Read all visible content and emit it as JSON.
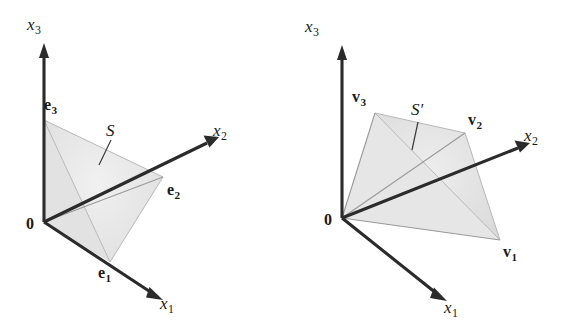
{
  "figure": {
    "background_color": "#ffffff",
    "ink_color": "#2b2b2b",
    "face_fill_color": "#e8e8e8",
    "edge_color": "#b9b9b9"
  },
  "panels": [
    {
      "id": "left",
      "region_label": "standard-simplex-panel",
      "set_label": {
        "text": "S",
        "prime": "",
        "style": "italic"
      },
      "origin_label": "0",
      "axes": [
        {
          "name": "x3",
          "base": "x",
          "subscript": "3",
          "direction": "up"
        },
        {
          "name": "x2",
          "base": "x",
          "subscript": "2",
          "direction": "upper-right"
        },
        {
          "name": "x1",
          "base": "x",
          "subscript": "1",
          "direction": "lower-right"
        }
      ],
      "vertices": [
        {
          "name": "e1",
          "base": "e",
          "subscript": "1",
          "style": "bold"
        },
        {
          "name": "e2",
          "base": "e",
          "subscript": "2",
          "style": "bold"
        },
        {
          "name": "e3",
          "base": "e",
          "subscript": "3",
          "style": "bold"
        }
      ]
    },
    {
      "id": "right",
      "region_label": "image-simplex-panel",
      "set_label": {
        "text": "S",
        "prime": "′",
        "style": "italic"
      },
      "origin_label": "0",
      "axes": [
        {
          "name": "x3",
          "base": "x",
          "subscript": "3",
          "direction": "up"
        },
        {
          "name": "x2",
          "base": "x",
          "subscript": "2",
          "direction": "upper-right"
        },
        {
          "name": "x1",
          "base": "x",
          "subscript": "1",
          "direction": "lower-right"
        }
      ],
      "vertices": [
        {
          "name": "v1",
          "base": "v",
          "subscript": "1",
          "style": "bold"
        },
        {
          "name": "v2",
          "base": "v",
          "subscript": "2",
          "style": "bold"
        },
        {
          "name": "v3",
          "base": "v",
          "subscript": "3",
          "style": "bold"
        }
      ]
    }
  ],
  "labels": {
    "left_x3_base": "x",
    "left_x3_sub": "3",
    "left_x2_base": "x",
    "left_x2_sub": "2",
    "left_x1_base": "x",
    "left_x1_sub": "1",
    "left_e1_base": "e",
    "left_e1_sub": "1",
    "left_e2_base": "e",
    "left_e2_sub": "2",
    "left_e3_base": "e",
    "left_e3_sub": "3",
    "left_origin": "0",
    "left_S": "S",
    "right_x3_base": "x",
    "right_x3_sub": "3",
    "right_x2_base": "x",
    "right_x2_sub": "2",
    "right_x1_base": "x",
    "right_x1_sub": "1",
    "right_v1_base": "v",
    "right_v1_sub": "1",
    "right_v2_base": "v",
    "right_v2_sub": "2",
    "right_v3_base": "v",
    "right_v3_sub": "3",
    "right_origin": "0",
    "right_S": "S",
    "right_S_prime": "′"
  }
}
